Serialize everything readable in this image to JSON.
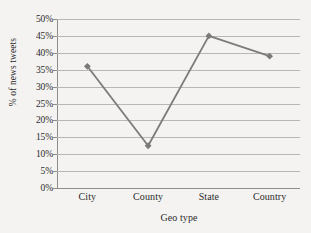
{
  "chart_data": {
    "type": "line",
    "title": "",
    "xlabel": "Geo type",
    "ylabel": "% of news tweets",
    "categories": [
      "City",
      "County",
      "State",
      "Country"
    ],
    "values": [
      36,
      12.5,
      45,
      39
    ],
    "series": [
      {
        "name": "% of news tweets",
        "values": [
          36,
          12.5,
          45,
          39
        ]
      }
    ],
    "ylim": [
      0,
      50
    ],
    "ytick_labels": [
      "0%",
      "5%",
      "10%",
      "15%",
      "20%",
      "25%",
      "30%",
      "35%",
      "40%",
      "45%",
      "50%"
    ],
    "ytick_values": [
      0,
      5,
      10,
      15,
      20,
      25,
      30,
      35,
      40,
      45,
      50
    ],
    "grid": "horizontal",
    "legend": "none",
    "marker": "diamond",
    "colors": {
      "line": "#7b7b7b",
      "marker": "#7a7a7a",
      "gridline": "#b9b7b4",
      "axis": "#8f8d8a",
      "text": "#2b2b2b",
      "background": "#f4f3f1"
    }
  }
}
